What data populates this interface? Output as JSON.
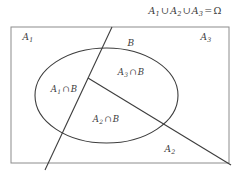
{
  "figure": {
    "type": "venn-partition-diagram",
    "caption": {
      "text": "A1 ∪ A2 ∪ A3 = Ω",
      "parts": {
        "a1": "A",
        "a1_sub": "1",
        "union1": "∪",
        "a2": "A",
        "a2_sub": "2",
        "union2": "∪",
        "a3": "A",
        "a3_sub": "3",
        "equals": "=",
        "omega": "Ω"
      }
    },
    "regions": [
      {
        "name": "A1",
        "base": "A",
        "sub": "1",
        "x": 28,
        "y": 38
      },
      {
        "name": "A3",
        "base": "A",
        "sub": "3",
        "x": 206,
        "y": 38
      },
      {
        "name": "A2",
        "base": "A",
        "sub": "2",
        "x": 170,
        "y": 150
      },
      {
        "name": "B",
        "base": "B",
        "sub": "",
        "x": 131,
        "y": 43
      }
    ],
    "intersections": [
      {
        "name": "A1 ∩ B",
        "base": "A",
        "sub": "1",
        "op": "∩",
        "second": "B",
        "x": 64,
        "y": 90
      },
      {
        "name": "A3 ∩ B",
        "base": "A",
        "sub": "3",
        "op": "∩",
        "second": "B",
        "x": 131,
        "y": 73
      },
      {
        "name": "A2 ∩ B",
        "base": "A",
        "sub": "2",
        "op": "∩",
        "second": "B",
        "x": 106,
        "y": 120
      }
    ],
    "colors": {
      "stroke": "#3d3d3d",
      "border": "#8c8c8c",
      "text": "#3a3a3a",
      "background": "#ffffff"
    },
    "geometry": {
      "rect": {
        "x": 11,
        "y": 27,
        "width": 218,
        "height": 136
      },
      "ellipse": {
        "cx": 106.5,
        "cy": 95.5,
        "rx": 71.5,
        "ry": 47.5
      },
      "steep_line": {
        "x1": 112,
        "y1": 27,
        "x2": 45,
        "y2": 170
      },
      "diagonal_line": {
        "x1": 88,
        "y1": 78,
        "x2": 231,
        "y2": 165
      },
      "vertex": {
        "x": 88,
        "y": 78
      }
    }
  }
}
